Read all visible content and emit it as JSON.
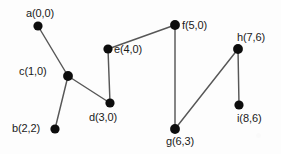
{
  "figure": {
    "type": "node-link-graph",
    "background_color": "#fdfdfd",
    "edge_color": "#575757",
    "node_color": "#0d0d0d",
    "label_color": "#1a1a1a",
    "width": 281,
    "height": 154
  },
  "nodes": [
    {
      "id": "a",
      "label": "a(0,0)",
      "coord_x": 0,
      "coord_y": 0,
      "px": 38,
      "py": 26,
      "r": 4.6,
      "label_x": 26,
      "label_y": 8,
      "label_anchor": "above-left"
    },
    {
      "id": "b",
      "label": "b(2,2)",
      "coord_x": 2,
      "coord_y": 2,
      "px": 55,
      "py": 129,
      "r": 4.6,
      "label_x": 12,
      "label_y": 123,
      "label_anchor": "left"
    },
    {
      "id": "c",
      "label": "c(1,0)",
      "coord_x": 1,
      "coord_y": 0,
      "px": 68,
      "py": 76,
      "r": 4.9,
      "label_x": 19,
      "label_y": 66,
      "label_anchor": "left"
    },
    {
      "id": "d",
      "label": "d(3,0)",
      "coord_x": 3,
      "coord_y": 0,
      "px": 110,
      "py": 103,
      "r": 4.6,
      "label_x": 89,
      "label_y": 112,
      "label_anchor": "below"
    },
    {
      "id": "e",
      "label": "e(4,0)",
      "coord_x": 4,
      "coord_y": 0,
      "px": 108,
      "py": 49,
      "r": 4.6,
      "label_x": 114,
      "label_y": 44,
      "label_anchor": "right"
    },
    {
      "id": "f",
      "label": "f(5,0)",
      "coord_x": 5,
      "coord_y": 0,
      "px": 175,
      "py": 25,
      "r": 4.9,
      "label_x": 182,
      "label_y": 20,
      "label_anchor": "right"
    },
    {
      "id": "g",
      "label": "g(6,3)",
      "coord_x": 6,
      "coord_y": 3,
      "px": 175,
      "py": 129,
      "r": 4.9,
      "label_x": 166,
      "label_y": 136,
      "label_anchor": "below"
    },
    {
      "id": "h",
      "label": "h(7,6)",
      "coord_x": 7,
      "coord_y": 6,
      "px": 238,
      "py": 49,
      "r": 4.9,
      "label_x": 237,
      "label_y": 32,
      "label_anchor": "above"
    },
    {
      "id": "i",
      "label": "i(8,6)",
      "coord_x": 8,
      "coord_y": 6,
      "px": 239,
      "py": 105,
      "r": 4.6,
      "label_x": 237,
      "label_y": 113,
      "label_anchor": "below"
    }
  ],
  "edges": [
    {
      "from": "a",
      "to": "c",
      "x1": 38,
      "y1": 26,
      "x2": 68,
      "y2": 76
    },
    {
      "from": "c",
      "to": "b",
      "x1": 68,
      "y1": 76,
      "x2": 55,
      "y2": 129
    },
    {
      "from": "c",
      "to": "d",
      "x1": 68,
      "y1": 76,
      "x2": 110,
      "y2": 103
    },
    {
      "from": "d",
      "to": "e",
      "x1": 110,
      "y1": 103,
      "x2": 108,
      "y2": 49
    },
    {
      "from": "e",
      "to": "f",
      "x1": 108,
      "y1": 49,
      "x2": 175,
      "y2": 25
    },
    {
      "from": "f",
      "to": "g",
      "x1": 175,
      "y1": 25,
      "x2": 175,
      "y2": 129
    },
    {
      "from": "g",
      "to": "h",
      "x1": 175,
      "y1": 129,
      "x2": 238,
      "y2": 49
    },
    {
      "from": "h",
      "to": "i",
      "x1": 238,
      "y1": 49,
      "x2": 239,
      "y2": 105
    }
  ]
}
